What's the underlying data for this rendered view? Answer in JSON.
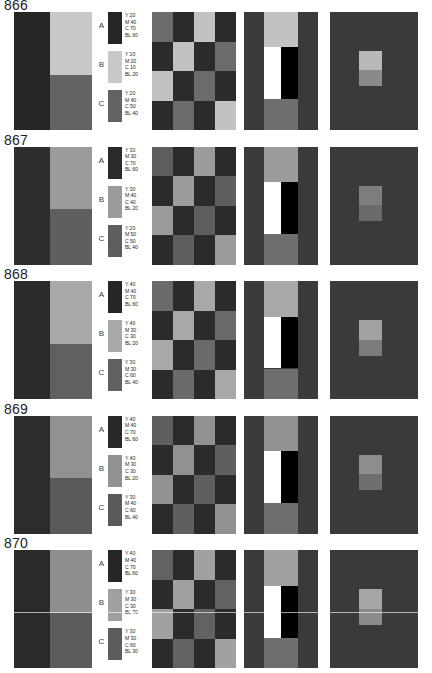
{
  "page": {
    "background": "#ffffff",
    "columns": [
      "quadrant-panel",
      "color-legend",
      "checkerboard-panel",
      "black-white-panel",
      "center-square-panel"
    ],
    "legend_labels": [
      "A",
      "B",
      "C"
    ],
    "ink_keys": [
      "Y",
      "M",
      "C",
      "BL"
    ]
  },
  "rows": [
    {
      "title": "866",
      "quadrant": {
        "left": "#262626",
        "top_right": "#c8c8c8",
        "bottom_right": "#636363"
      },
      "legend": [
        {
          "label": "A",
          "swatch": "#262626",
          "values": [
            "Y 20",
            "M 40",
            "C 70",
            "BL 60"
          ]
        },
        {
          "label": "B",
          "swatch": "#c8c8c8",
          "values": [
            "Y 20",
            "M 20",
            "C 10",
            "BL 20"
          ]
        },
        {
          "label": "C",
          "swatch": "#636363",
          "values": [
            "Y 20",
            "M 40",
            "C 50",
            "BL 40"
          ]
        }
      ],
      "checkerboard": [
        "#6b6b6b",
        "#2b2b2b",
        "#c2c2c2",
        "#2b2b2b",
        "#2b2b2b",
        "#c2c2c2",
        "#2b2b2b",
        "#6b6b6b",
        "#c2c2c2",
        "#2b2b2b",
        "#6b6b6b",
        "#2b2b2b",
        "#2b2b2b",
        "#6b6b6b",
        "#2b2b2b",
        "#c2c2c2"
      ],
      "bw_panel": {
        "background": "#3a3a3a",
        "top_band": "#c2c2c2",
        "bottom_band": "#6e6e6e",
        "white": "#ffffff",
        "black": "#000000"
      },
      "center_square": {
        "background": "#3a3a3a",
        "square_top": "#b9b9b9",
        "square_bottom": "#8a8a8a"
      },
      "scanline": false
    },
    {
      "title": "867",
      "quadrant": {
        "left": "#2e2e2e",
        "top_right": "#9b9b9b",
        "bottom_right": "#5e5e5e"
      },
      "legend": [
        {
          "label": "A",
          "swatch": "#2a2a2a",
          "values": [
            "Y 30",
            "M 30",
            "C 70",
            "BL 60"
          ]
        },
        {
          "label": "B",
          "swatch": "#9b9b9b",
          "values": [
            "Y 30",
            "M 40",
            "C 40",
            "BL 20"
          ]
        },
        {
          "label": "C",
          "swatch": "#5e5e5e",
          "values": [
            "Y 20",
            "M 50",
            "C 50",
            "BL 40"
          ]
        }
      ],
      "checkerboard": [
        "#5e5e5e",
        "#2b2b2b",
        "#9b9b9b",
        "#2b2b2b",
        "#2b2b2b",
        "#9b9b9b",
        "#2b2b2b",
        "#5e5e5e",
        "#9b9b9b",
        "#2b2b2b",
        "#5e5e5e",
        "#2b2b2b",
        "#2b2b2b",
        "#5e5e5e",
        "#2b2b2b",
        "#9b9b9b"
      ],
      "bw_panel": {
        "background": "#3a3a3a",
        "top_band": "#9b9b9b",
        "bottom_band": "#6e6e6e",
        "white": "#ffffff",
        "black": "#000000"
      },
      "center_square": {
        "background": "#3a3a3a",
        "square_top": "#7d7d7d",
        "square_bottom": "#6a6a6a"
      },
      "scanline": false
    },
    {
      "title": "868",
      "quadrant": {
        "left": "#2a2a2a",
        "top_right": "#a8a8a8",
        "bottom_right": "#606060"
      },
      "legend": [
        {
          "label": "A",
          "swatch": "#262626",
          "values": [
            "Y 40",
            "M 40",
            "C 70",
            "BL 60"
          ]
        },
        {
          "label": "B",
          "swatch": "#a8a8a8",
          "values": [
            "Y 40",
            "M 30",
            "C 30",
            "BL 20"
          ]
        },
        {
          "label": "C",
          "swatch": "#606060",
          "values": [
            "Y 30",
            "M 30",
            "C 60",
            "BL 40"
          ]
        }
      ],
      "checkerboard": [
        "#6a6a6a",
        "#2b2b2b",
        "#a8a8a8",
        "#2b2b2b",
        "#2b2b2b",
        "#a8a8a8",
        "#2b2b2b",
        "#6a6a6a",
        "#a8a8a8",
        "#2b2b2b",
        "#6a6a6a",
        "#2b2b2b",
        "#2b2b2b",
        "#6a6a6a",
        "#2b2b2b",
        "#a8a8a8"
      ],
      "bw_panel": {
        "background": "#3a3a3a",
        "top_band": "#a8a8a8",
        "bottom_band": "#6e6e6e",
        "white": "#ffffff",
        "black": "#000000"
      },
      "center_square": {
        "background": "#3a3a3a",
        "square_top": "#a2a2a2",
        "square_bottom": "#7b7b7b"
      },
      "scanline": false
    },
    {
      "title": "869",
      "quadrant": {
        "left": "#2c2c2c",
        "top_right": "#919191",
        "bottom_right": "#5a5a5a"
      },
      "legend": [
        {
          "label": "A",
          "swatch": "#282828",
          "values": [
            "Y 40",
            "M 40",
            "C 70",
            "BL 60"
          ]
        },
        {
          "label": "B",
          "swatch": "#919191",
          "values": [
            "Y 40",
            "M 30",
            "C 30",
            "BL 20"
          ]
        },
        {
          "label": "C",
          "swatch": "#5a5a5a",
          "values": [
            "Y 30",
            "M 40",
            "C 60",
            "BL 40"
          ]
        }
      ],
      "checkerboard": [
        "#5f5f5f",
        "#2b2b2b",
        "#919191",
        "#2b2b2b",
        "#2b2b2b",
        "#919191",
        "#2b2b2b",
        "#5f5f5f",
        "#919191",
        "#2b2b2b",
        "#5f5f5f",
        "#2b2b2b",
        "#2b2b2b",
        "#5f5f5f",
        "#2b2b2b",
        "#919191"
      ],
      "bw_panel": {
        "background": "#3a3a3a",
        "top_band": "#919191",
        "bottom_band": "#6e6e6e",
        "white": "#ffffff",
        "black": "#000000"
      },
      "center_square": {
        "background": "#3a3a3a",
        "square_top": "#8d8d8d",
        "square_bottom": "#6f6f6f"
      },
      "scanline": false
    },
    {
      "title": "870",
      "quadrant": {
        "left": "#2a2a2a",
        "top_right": "#8e8e8e",
        "bottom_right": "#5c5c5c"
      },
      "legend": [
        {
          "label": "A",
          "swatch": "#262626",
          "values": [
            "Y 40",
            "M 40",
            "C 70",
            "BL 60"
          ]
        },
        {
          "label": "B",
          "swatch": "#a0a0a0",
          "values": [
            "Y 30",
            "M 30",
            "C 30",
            "BL 70"
          ]
        },
        {
          "label": "C",
          "swatch": "#5c5c5c",
          "values": [
            "Y 30",
            "M 30",
            "C 60",
            "BL 30"
          ]
        }
      ],
      "checkerboard": [
        "#626262",
        "#2b2b2b",
        "#a0a0a0",
        "#2b2b2b",
        "#2b2b2b",
        "#a0a0a0",
        "#2b2b2b",
        "#626262",
        "#a0a0a0",
        "#2b2b2b",
        "#626262",
        "#2b2b2b",
        "#2b2b2b",
        "#626262",
        "#2b2b2b",
        "#a0a0a0"
      ],
      "bw_panel": {
        "background": "#3a3a3a",
        "top_band": "#a0a0a0",
        "bottom_band": "#6e6e6e",
        "white": "#ffffff",
        "black": "#000000"
      },
      "center_square": {
        "background": "#3a3a3a",
        "square_top": "#a6a6a6",
        "square_bottom": "#8b8b8b"
      },
      "scanline": true
    }
  ]
}
